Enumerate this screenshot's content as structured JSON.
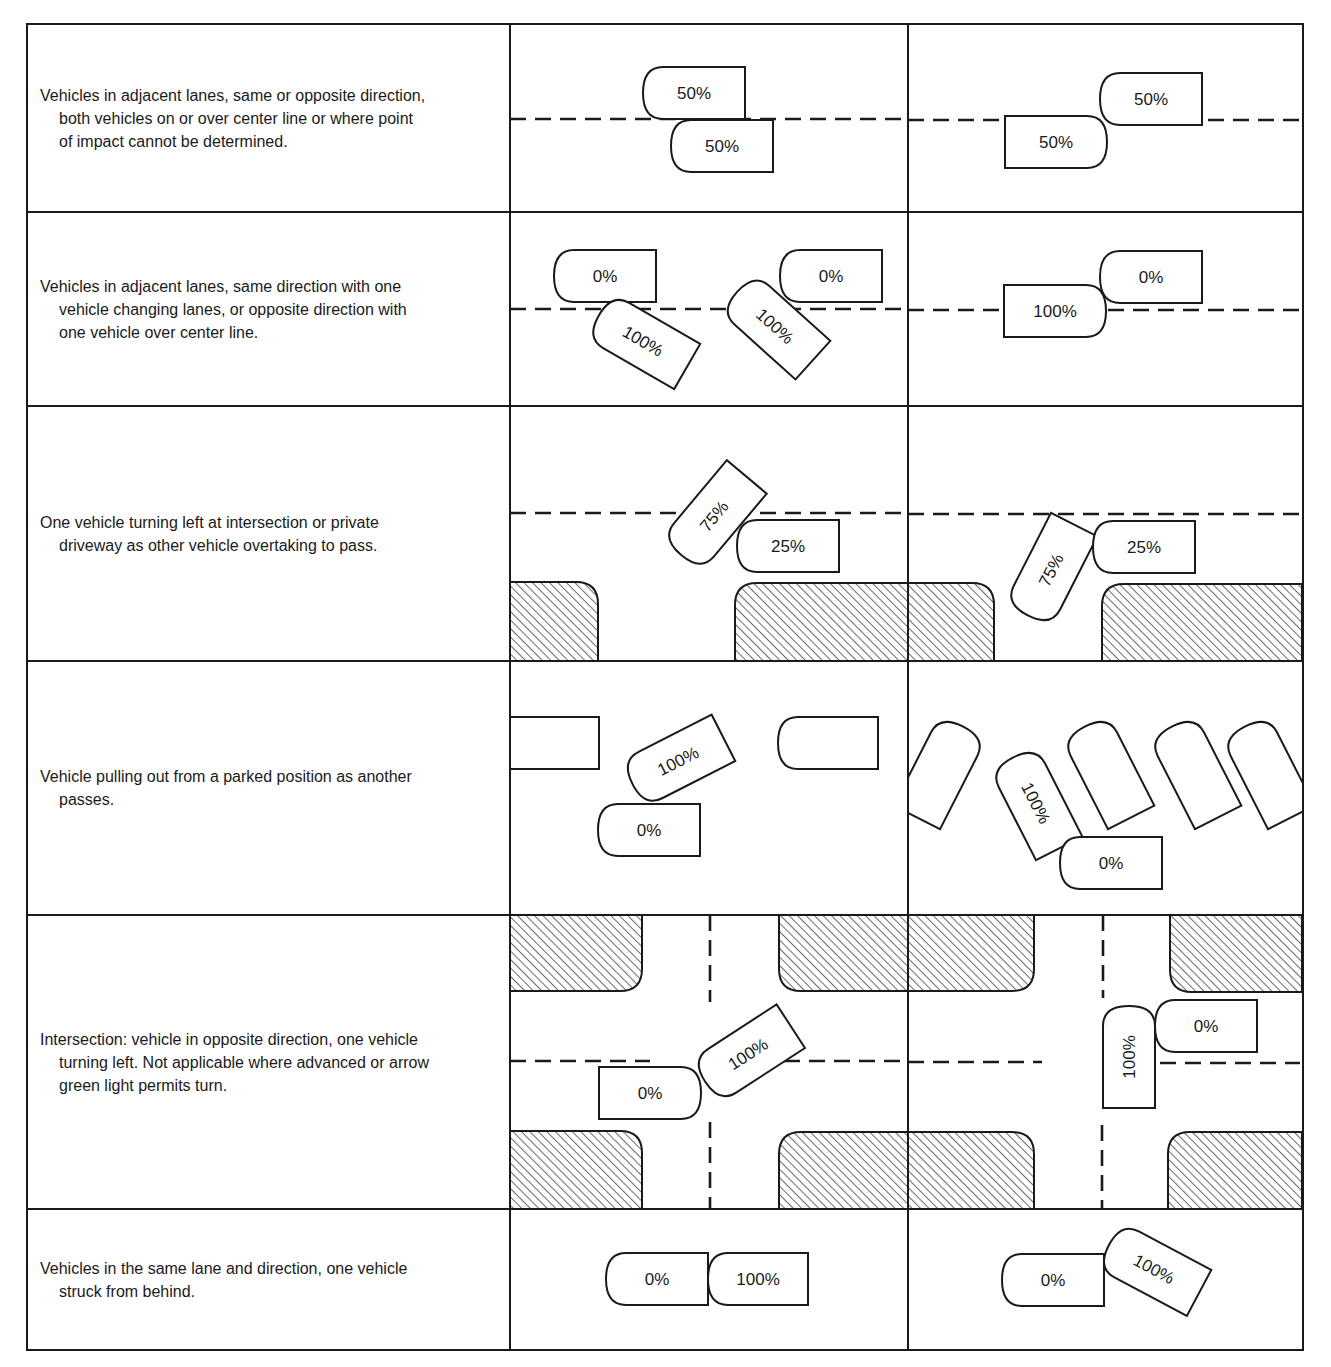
{
  "colors": {
    "ink": "#1a1a1a",
    "paper": "#ffffff"
  },
  "rows": [
    {
      "id": "row-1",
      "top": 24,
      "bottom": 212,
      "description": {
        "first": "Vehicles in adjacent lanes, same or opposite direction,",
        "rest": [
          "both vehicles on or over center line or where point",
          "of impact cannot be determined."
        ]
      },
      "diagrams": [
        {
          "lines": [
            {
              "type": "h-dash",
              "y": 119,
              "x1": 510,
              "x2": 908
            }
          ],
          "vehicles": [
            {
              "label": "50%",
              "cx": 694,
              "cy": 93,
              "w": 102,
              "h": 52,
              "rot": 0,
              "front": "left"
            },
            {
              "label": "50%",
              "cx": 722,
              "cy": 146,
              "w": 102,
              "h": 52,
              "rot": 0,
              "front": "left"
            }
          ]
        },
        {
          "lines": [
            {
              "type": "h-dash",
              "y": 120,
              "x1": 908,
              "x2": 1303
            }
          ],
          "vehicles": [
            {
              "label": "50%",
              "cx": 1151,
              "cy": 99,
              "w": 102,
              "h": 52,
              "rot": 0,
              "front": "left"
            },
            {
              "label": "50%",
              "cx": 1056,
              "cy": 142,
              "w": 102,
              "h": 52,
              "rot": 0,
              "front": "right"
            }
          ]
        }
      ]
    },
    {
      "id": "row-2",
      "top": 212,
      "bottom": 406,
      "description": {
        "first": "Vehicles in adjacent lanes, same direction with one",
        "rest": [
          "vehicle changing lanes, or opposite direction with",
          "one vehicle over center line."
        ]
      },
      "diagrams": [
        {
          "lines": [
            {
              "type": "h-dash",
              "y": 309,
              "x1": 510,
              "x2": 908
            }
          ],
          "vehicles": [
            {
              "label": "0%",
              "cx": 605,
              "cy": 276,
              "w": 102,
              "h": 52,
              "rot": 0,
              "front": "left"
            },
            {
              "label": "100%",
              "cx": 643,
              "cy": 341,
              "w": 102,
              "h": 52,
              "rot": 30,
              "front": "left"
            },
            {
              "label": "0%",
              "cx": 831,
              "cy": 276,
              "w": 102,
              "h": 52,
              "rot": 0,
              "front": "left"
            },
            {
              "label": "100%",
              "cx": 775,
              "cy": 326,
              "w": 102,
              "h": 52,
              "rot": 42,
              "front": "left"
            }
          ]
        },
        {
          "lines": [
            {
              "type": "h-dash",
              "y": 310,
              "x1": 908,
              "x2": 1303
            }
          ],
          "vehicles": [
            {
              "label": "0%",
              "cx": 1151,
              "cy": 277,
              "w": 102,
              "h": 52,
              "rot": 0,
              "front": "left"
            },
            {
              "label": "100%",
              "cx": 1055,
              "cy": 311,
              "w": 102,
              "h": 52,
              "rot": 0,
              "front": "right"
            }
          ]
        }
      ]
    },
    {
      "id": "row-3",
      "top": 406,
      "bottom": 661,
      "description": {
        "first": "One vehicle turning left at intersection or private",
        "rest": [
          "driveway as other vehicle overtaking to pass."
        ]
      },
      "diagrams": [
        {
          "lines": [
            {
              "type": "h-dash",
              "y": 513,
              "x1": 510,
              "x2": 908
            }
          ],
          "blocks": [
            {
              "x": 510,
              "y": 582,
              "w": 88,
              "h": 79,
              "r": [
                "tr"
              ]
            },
            {
              "x": 735,
              "y": 583,
              "w": 173,
              "h": 78,
              "r": [
                "tl"
              ]
            }
          ],
          "vehicles": [
            {
              "label": "75%",
              "cx": 714,
              "cy": 516,
              "w": 102,
              "h": 52,
              "rot": -50,
              "front": "left"
            },
            {
              "label": "25%",
              "cx": 788,
              "cy": 546,
              "w": 102,
              "h": 52,
              "rot": 0,
              "front": "left"
            }
          ]
        },
        {
          "lines": [
            {
              "type": "h-dash",
              "y": 514,
              "x1": 908,
              "x2": 1303
            }
          ],
          "blocks": [
            {
              "x": 908,
              "y": 583,
              "w": 86,
              "h": 78,
              "r": [
                "tr"
              ]
            },
            {
              "x": 1102,
              "y": 584,
              "w": 200,
              "h": 77,
              "r": [
                "tl"
              ]
            }
          ],
          "vehicles": [
            {
              "label": "75%",
              "cx": 1051,
              "cy": 570,
              "w": 102,
              "h": 52,
              "rot": -63,
              "front": "left"
            },
            {
              "label": "25%",
              "cx": 1144,
              "cy": 547,
              "w": 102,
              "h": 52,
              "rot": 0,
              "front": "left"
            }
          ]
        }
      ]
    },
    {
      "id": "row-4",
      "top": 661,
      "bottom": 915,
      "description": {
        "first": "Vehicle pulling out from a parked position as another",
        "rest": [
          "passes."
        ]
      },
      "diagrams": [
        {
          "lines": [],
          "vehicles": [
            {
              "label": "",
              "cx": 554,
              "cy": 743,
              "w": 90,
              "h": 52,
              "rot": 0,
              "front": "none"
            },
            {
              "label": "100%",
              "cx": 678,
              "cy": 761,
              "w": 102,
              "h": 52,
              "rot": -27,
              "front": "left"
            },
            {
              "label": "0%",
              "cx": 649,
              "cy": 830,
              "w": 102,
              "h": 52,
              "rot": 0,
              "front": "left"
            },
            {
              "label": "",
              "cx": 828,
              "cy": 743,
              "w": 100,
              "h": 52,
              "rot": 0,
              "front": "left"
            }
          ]
        },
        {
          "lines": [],
          "vehicles": [
            {
              "label": "",
              "cx": 940,
              "cy": 772,
              "w": 102,
              "h": 52,
              "rot": -63,
              "front": "right",
              "clipLeft": true
            },
            {
              "label": "100%",
              "cx": 1036,
              "cy": 803,
              "w": 102,
              "h": 52,
              "rot": 63,
              "front": "left"
            },
            {
              "label": "0%",
              "cx": 1111,
              "cy": 863,
              "w": 102,
              "h": 52,
              "rot": 0,
              "front": "left"
            },
            {
              "label": "",
              "cx": 1108,
              "cy": 772,
              "w": 102,
              "h": 52,
              "rot": 63,
              "front": "left"
            },
            {
              "label": "",
              "cx": 1195,
              "cy": 772,
              "w": 102,
              "h": 52,
              "rot": 63,
              "front": "left"
            },
            {
              "label": "",
              "cx": 1268,
              "cy": 772,
              "w": 102,
              "h": 52,
              "rot": 63,
              "front": "left"
            }
          ]
        }
      ]
    },
    {
      "id": "row-5",
      "top": 915,
      "bottom": 1209,
      "description": {
        "first": "Intersection:  vehicle in opposite direction, one vehicle",
        "rest": [
          "turning left. Not applicable where advanced or arrow",
          "green light permits turn."
        ]
      },
      "diagrams": [
        {
          "lines": [
            {
              "type": "h-dash",
              "y": 1061,
              "x1": 510,
              "x2": 650
            },
            {
              "type": "h-dash",
              "y": 1061,
              "x1": 784,
              "x2": 908
            },
            {
              "type": "v-dash",
              "x": 710,
              "y1": 915,
              "y2": 1002
            },
            {
              "type": "v-dash",
              "x": 710,
              "y1": 1122,
              "y2": 1209
            }
          ],
          "blocks": [
            {
              "x": 510,
              "y": 915,
              "w": 132,
              "h": 76,
              "r": [
                "br"
              ]
            },
            {
              "x": 779,
              "y": 915,
              "w": 129,
              "h": 76,
              "r": [
                "bl"
              ]
            },
            {
              "x": 510,
              "y": 1131,
              "w": 132,
              "h": 78,
              "r": [
                "tr"
              ]
            },
            {
              "x": 779,
              "y": 1132,
              "w": 129,
              "h": 77,
              "r": [
                "tl"
              ]
            }
          ],
          "vehicles": [
            {
              "label": "0%",
              "cx": 650,
              "cy": 1093,
              "w": 102,
              "h": 52,
              "rot": 0,
              "front": "right"
            },
            {
              "label": "100%",
              "cx": 748,
              "cy": 1054,
              "w": 102,
              "h": 52,
              "rot": -33,
              "front": "left"
            }
          ]
        },
        {
          "lines": [
            {
              "type": "h-dash",
              "y": 1062,
              "x1": 908,
              "x2": 1042
            },
            {
              "type": "h-dash",
              "y": 1063,
              "x1": 1160,
              "x2": 1300
            },
            {
              "type": "v-dash",
              "x": 1103,
              "y1": 915,
              "y2": 998
            },
            {
              "type": "v-dash",
              "x": 1102,
              "y1": 1125,
              "y2": 1209
            }
          ],
          "blocks": [
            {
              "x": 908,
              "y": 915,
              "w": 126,
              "h": 76,
              "r": [
                "br"
              ]
            },
            {
              "x": 1170,
              "y": 915,
              "w": 132,
              "h": 77,
              "r": [
                "bl"
              ]
            },
            {
              "x": 908,
              "y": 1132,
              "w": 126,
              "h": 77,
              "r": [
                "tr"
              ]
            },
            {
              "x": 1168,
              "y": 1132,
              "w": 134,
              "h": 77,
              "r": [
                "tl"
              ]
            }
          ],
          "vehicles": [
            {
              "label": "0%",
              "cx": 1206,
              "cy": 1026,
              "w": 102,
              "h": 52,
              "rot": 0,
              "front": "left"
            },
            {
              "label": "100%",
              "cx": 1129,
              "cy": 1057,
              "w": 102,
              "h": 52,
              "rot": -90,
              "front": "right"
            }
          ]
        }
      ]
    },
    {
      "id": "row-6",
      "top": 1209,
      "bottom": 1350,
      "description": {
        "first": "Vehicles in the same lane and direction, one vehicle",
        "rest": [
          "struck from behind."
        ]
      },
      "diagrams": [
        {
          "lines": [],
          "vehicles": [
            {
              "label": "0%",
              "cx": 657,
              "cy": 1279,
              "w": 102,
              "h": 52,
              "rot": 0,
              "front": "left"
            },
            {
              "label": "100%",
              "cx": 758,
              "cy": 1279,
              "w": 100,
              "h": 52,
              "rot": 0,
              "front": "left"
            }
          ]
        },
        {
          "lines": [],
          "vehicles": [
            {
              "label": "0%",
              "cx": 1053,
              "cy": 1280,
              "w": 102,
              "h": 52,
              "rot": 0,
              "front": "left"
            },
            {
              "label": "100%",
              "cx": 1154,
              "cy": 1269,
              "w": 102,
              "h": 52,
              "rot": 28,
              "front": "left"
            }
          ]
        }
      ]
    }
  ],
  "grid": {
    "left": 27,
    "right": 1303,
    "top": 24,
    "bottom": 1350,
    "col_dividers": [
      510,
      908
    ]
  }
}
